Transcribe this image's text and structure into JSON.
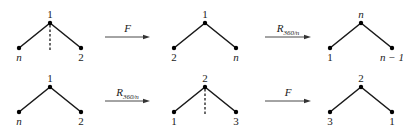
{
  "diagram": {
    "rows": [
      {
        "name": "top-row",
        "configs": [
          {
            "name": "start",
            "apex": "1",
            "left": "n",
            "right": "2",
            "axis_of_reflection": true
          },
          {
            "name": "after-first",
            "apex": "1",
            "left": "2",
            "right": "n",
            "axis_of_reflection": false
          },
          {
            "name": "after-second",
            "apex": "n",
            "left": "1",
            "right": "n − 1",
            "axis_of_reflection": false
          }
        ],
        "arrows": [
          {
            "label_main": "F",
            "label_sub": ""
          },
          {
            "label_main": "R",
            "label_sub": "360/n"
          }
        ]
      },
      {
        "name": "bottom-row",
        "configs": [
          {
            "name": "start",
            "apex": "1",
            "left": "n",
            "right": "2",
            "axis_of_reflection": false
          },
          {
            "name": "after-first",
            "apex": "2",
            "left": "1",
            "right": "3",
            "axis_of_reflection": true
          },
          {
            "name": "after-second",
            "apex": "2",
            "left": "3",
            "right": "1",
            "axis_of_reflection": false
          }
        ],
        "arrows": [
          {
            "label_main": "R",
            "label_sub": "360/n"
          },
          {
            "label_main": "F",
            "label_sub": ""
          }
        ]
      }
    ],
    "colors": {
      "line": "#1a1a1a",
      "arrow": "#333333",
      "background": "#ffffff"
    }
  }
}
